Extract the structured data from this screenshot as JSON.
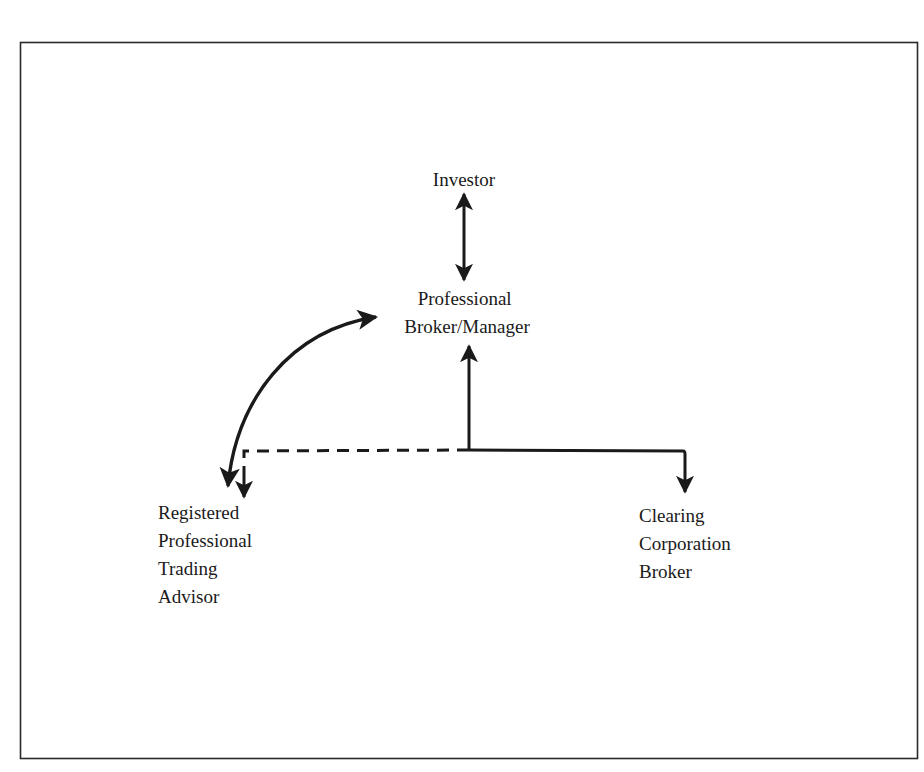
{
  "diagram": {
    "type": "flow",
    "nodes": {
      "investor": {
        "lines": [
          "Investor"
        ]
      },
      "broker_manager": {
        "lines": [
          "Professional",
          "Broker/Manager"
        ]
      },
      "trading_advisor": {
        "lines": [
          "Registered",
          "Professional",
          "Trading",
          "Advisor"
        ]
      },
      "clearing_broker": {
        "lines": [
          "Clearing",
          "Corporation",
          "Broker"
        ]
      }
    },
    "edges": [
      {
        "from": "investor",
        "to": "broker_manager",
        "style": "solid",
        "direction": "both"
      },
      {
        "from": "junction",
        "to": "broker_manager",
        "style": "solid",
        "direction": "forward"
      },
      {
        "from": "junction",
        "to": "clearing_broker",
        "style": "solid",
        "direction": "forward"
      },
      {
        "from": "junction",
        "to": "trading_advisor",
        "style": "dashed",
        "direction": "forward"
      },
      {
        "from": "trading_advisor",
        "to": "broker_manager",
        "style": "solid-curved",
        "direction": "both"
      }
    ],
    "colors": {
      "stroke": "#1a1a1a",
      "background": "#ffffff",
      "frame": "#2a2a2a"
    }
  }
}
